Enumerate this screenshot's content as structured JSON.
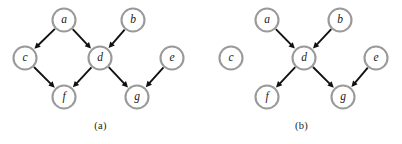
{
  "figure": {
    "width": 402,
    "height": 144,
    "background": "#ffffff",
    "node_stroke_color": "#9a9a9a",
    "node_fill_color": "#ffffff",
    "edge_color": "#111111",
    "label_color": "#1a1a1a",
    "node_radius": 11.5
  },
  "panels": [
    {
      "id": "a",
      "caption": "(a)",
      "nodes": [
        {
          "id": "a",
          "label": "a",
          "cx": 64,
          "cy": 20
        },
        {
          "id": "b",
          "label": "b",
          "cx": 133,
          "cy": 20
        },
        {
          "id": "c",
          "label": "c",
          "cx": 25,
          "cy": 58
        },
        {
          "id": "d",
          "label": "d",
          "cx": 100,
          "cy": 58
        },
        {
          "id": "e",
          "label": "e",
          "cx": 172,
          "cy": 58
        },
        {
          "id": "f",
          "label": "f",
          "cx": 64,
          "cy": 97
        },
        {
          "id": "g",
          "label": "g",
          "cx": 137,
          "cy": 97
        }
      ],
      "edges": [
        {
          "from": "a",
          "to": "c"
        },
        {
          "from": "a",
          "to": "d"
        },
        {
          "from": "b",
          "to": "d"
        },
        {
          "from": "c",
          "to": "f"
        },
        {
          "from": "d",
          "to": "f"
        },
        {
          "from": "d",
          "to": "g"
        },
        {
          "from": "e",
          "to": "g"
        }
      ]
    },
    {
      "id": "b",
      "caption": "(b)",
      "nodes": [
        {
          "id": "a",
          "label": "a",
          "cx": 66,
          "cy": 20
        },
        {
          "id": "b",
          "label": "b",
          "cx": 139,
          "cy": 20
        },
        {
          "id": "c",
          "label": "c",
          "cx": 30,
          "cy": 58
        },
        {
          "id": "d",
          "label": "d",
          "cx": 103,
          "cy": 58
        },
        {
          "id": "e",
          "label": "e",
          "cx": 175,
          "cy": 58
        },
        {
          "id": "f",
          "label": "f",
          "cx": 66,
          "cy": 97
        },
        {
          "id": "g",
          "label": "g",
          "cx": 142,
          "cy": 97
        }
      ],
      "edges": [
        {
          "from": "a",
          "to": "d"
        },
        {
          "from": "b",
          "to": "d"
        },
        {
          "from": "d",
          "to": "f"
        },
        {
          "from": "d",
          "to": "g"
        },
        {
          "from": "e",
          "to": "g"
        }
      ]
    }
  ]
}
